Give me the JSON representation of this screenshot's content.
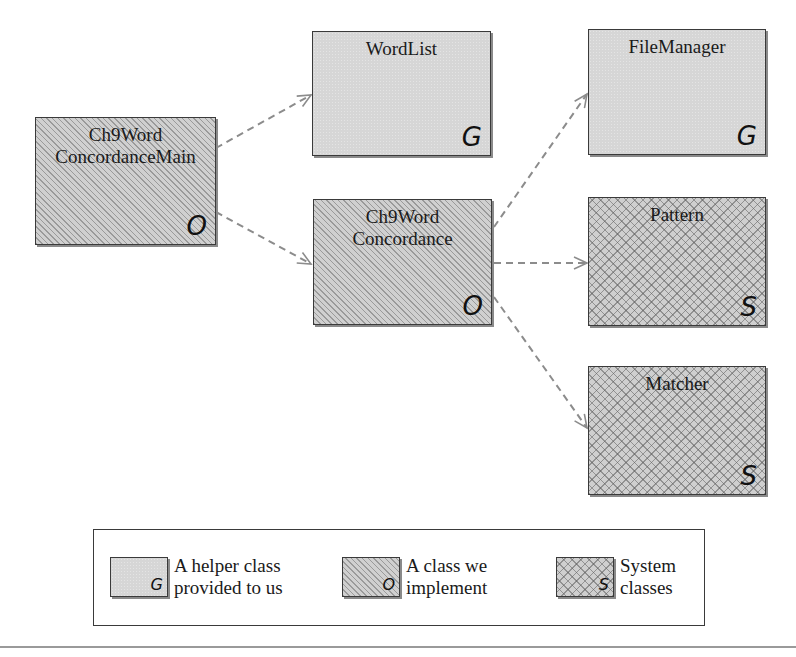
{
  "diagram": {
    "type": "class-dependency-diagram",
    "colors": {
      "arrow": "#8c8c8c",
      "border": "#3a3a3a",
      "helper_fill": "#d6d6d6",
      "implement_fill": "#d0d0d0",
      "system_fill": "#cfcfcf"
    },
    "nodes": [
      {
        "id": "main",
        "line1": "Ch9Word",
        "line2": "ConcordanceMain",
        "badge": "O",
        "kind": "implement"
      },
      {
        "id": "wordlist",
        "line1": "WordList",
        "line2": "",
        "badge": "G",
        "kind": "helper"
      },
      {
        "id": "filemanager",
        "line1": "FileManager",
        "line2": "",
        "badge": "G",
        "kind": "helper"
      },
      {
        "id": "concordance",
        "line1": "Ch9Word",
        "line2": "Concordance",
        "badge": "O",
        "kind": "implement"
      },
      {
        "id": "pattern",
        "line1": "Pattern",
        "line2": "",
        "badge": "S",
        "kind": "system"
      },
      {
        "id": "matcher",
        "line1": "Matcher",
        "line2": "",
        "badge": "S",
        "kind": "system"
      }
    ],
    "edges": [
      {
        "from": "Ch9WordConcordanceMain",
        "to": "WordList",
        "style": "dashed"
      },
      {
        "from": "Ch9WordConcordanceMain",
        "to": "Ch9WordConcordance",
        "style": "dashed"
      },
      {
        "from": "Ch9WordConcordance",
        "to": "FileManager",
        "style": "dashed"
      },
      {
        "from": "Ch9WordConcordance",
        "to": "Pattern",
        "style": "dashed"
      },
      {
        "from": "Ch9WordConcordance",
        "to": "Matcher",
        "style": "dashed"
      }
    ]
  },
  "legend": {
    "items": [
      {
        "badge": "G",
        "line1": "A helper class",
        "line2": "provided to us",
        "kind": "helper"
      },
      {
        "badge": "O",
        "line1": "A class we",
        "line2": "implement",
        "kind": "implement"
      },
      {
        "badge": "S",
        "line1": "System",
        "line2": "classes",
        "kind": "system"
      }
    ]
  }
}
